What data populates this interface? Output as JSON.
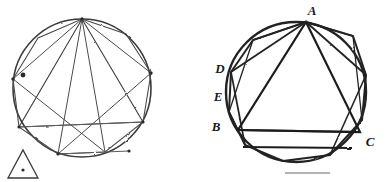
{
  "figure": {
    "background_color": "#ffffff",
    "ink_color": "#2b2b2b",
    "faint_ink_color": "#6f6f6f",
    "panels": [
      {
        "name": "left-panel",
        "caption": "",
        "circle": {
          "cx": 82,
          "cy": 88,
          "r": 69
        },
        "inscribed_polygon_sides": 9,
        "inscribed_triangle_labels": [],
        "has_marker_dot": true,
        "marker_dot": {
          "cx": 23,
          "cy": 75,
          "r": 2
        },
        "corner_triangle": {
          "name": "small-triangle-glyph",
          "points": "8,178 23,150 38,178",
          "center_dot": {
            "cx": 23,
            "cy": 170,
            "r": 1.6
          }
        }
      },
      {
        "name": "right-panel",
        "caption": "",
        "circle": {
          "cx": 296,
          "cy": 92,
          "r": 70
        },
        "inscribed_polygon_sides": 11,
        "inscribed_triangle_labels": [
          "A",
          "B",
          "C"
        ],
        "has_marker_dot": false
      }
    ],
    "vertex_labels": [
      {
        "id": "label-A",
        "text": "A",
        "x": 312,
        "y": 15
      },
      {
        "id": "label-D",
        "text": "D",
        "x": 220,
        "y": 73
      },
      {
        "id": "label-E",
        "text": "E",
        "x": 218,
        "y": 101
      },
      {
        "id": "label-B",
        "text": "B",
        "x": 216,
        "y": 131
      },
      {
        "id": "label-C",
        "text": "C",
        "x": 366,
        "y": 146
      }
    ],
    "footer_rule": {
      "name": "footer-rule",
      "x1": 285,
      "y1": 173,
      "x2": 330,
      "y2": 173
    }
  }
}
